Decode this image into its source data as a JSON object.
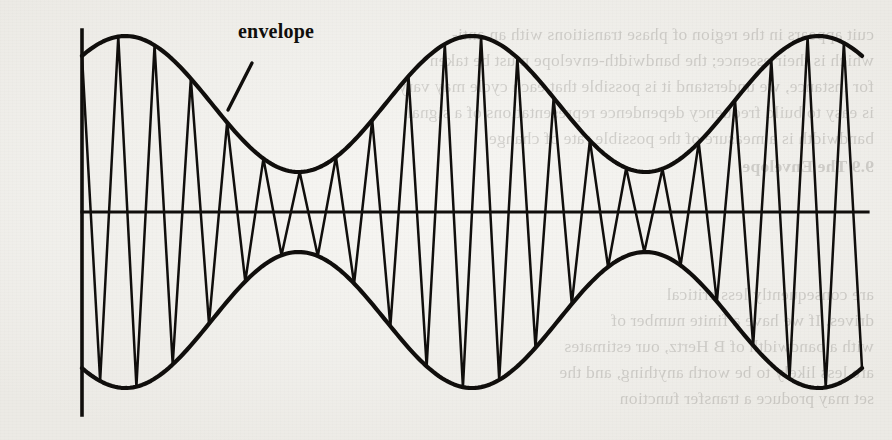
{
  "figure": {
    "caption_labels": {
      "envelope": "envelope",
      "y_axis": "ampl",
      "x_axis": "time"
    },
    "ink_color": "#100e0c",
    "paper_color": "#f2f1ee"
  },
  "chart_data": {
    "type": "line",
    "title": "",
    "subtitle": "",
    "xlabel": "time",
    "ylabel": "ampl",
    "grid": false,
    "legend_position": "none",
    "annotations": [
      {
        "text": "envelope",
        "target": "upper envelope curve",
        "leader_line": {
          "x1": 252,
          "y1": 63,
          "x2": 228,
          "y2": 110
        }
      }
    ],
    "axes": {
      "x_axis_y": 212,
      "y_axis_x": 82,
      "x_axis_from": 82,
      "x_axis_to": 868,
      "y_axis_from": 30,
      "y_axis_to": 415,
      "ticks": [],
      "tick_labels": [],
      "xlim": [
        0,
        1
      ],
      "ylim": [
        -1,
        1
      ]
    },
    "series": [
      {
        "name": "carrier",
        "type": "line",
        "peaks": 22,
        "waveform": "triangular",
        "description": "carrier oscillation filling the envelope"
      },
      {
        "name": "upper envelope",
        "type": "line",
        "waveform": "sinusoidal",
        "cycles": 2.25,
        "description": "upper bound of the modulated amplitude"
      },
      {
        "name": "lower envelope",
        "type": "line",
        "waveform": "sinusoidal",
        "cycles": 2.25,
        "description": "lower bound, mirror image of the upper envelope"
      }
    ],
    "envelope_model": {
      "carrier_count": 22,
      "carrier_start_x": 82,
      "carrier_end_x": 862,
      "modulation_cycles": 2.25,
      "modulation_phase_deg": 45,
      "amplitude_max": 176,
      "amplitude_min": 40,
      "baseline_y": 212
    },
    "x": [
      0.0,
      0.05,
      0.1,
      0.15,
      0.2,
      0.25,
      0.3,
      0.35,
      0.4,
      0.45,
      0.5,
      0.55,
      0.6,
      0.65,
      0.7,
      0.75,
      0.8,
      0.85,
      0.9,
      0.95,
      1.0
    ],
    "envelope_upper": [
      0.63,
      0.86,
      0.99,
      0.97,
      0.8,
      0.55,
      0.31,
      0.17,
      0.19,
      0.36,
      0.61,
      0.85,
      0.99,
      0.96,
      0.78,
      0.52,
      0.29,
      0.17,
      0.21,
      0.4,
      0.65
    ],
    "envelope_lower": [
      -0.63,
      -0.86,
      -0.99,
      -0.97,
      -0.8,
      -0.55,
      -0.31,
      -0.17,
      -0.19,
      -0.36,
      -0.61,
      -0.85,
      -0.99,
      -0.96,
      -0.78,
      -0.52,
      -0.29,
      -0.17,
      -0.21,
      -0.4,
      -0.65
    ]
  },
  "background_bleed": {
    "note": "faint mirror-image show-through from the reverse side of the scanned page",
    "top_lines": [
      "cuit appears in the region of phase transitions with an anti-",
      "which is their essence; the bandwidth-envelope must be taken",
      "for instance, we understand it is possible that each cycle may vary",
      "is easy to build frequency dependence representations of a signal",
      "bandwidth is a measure of the possible rate of change"
    ],
    "top_heading": "9.9  The Envelope",
    "bottom_lines": [
      "are consequently less critical",
      "drives.  If we have a finite number of",
      "with a bandwidth of B Hertz, our estimates",
      "are less likely to be worth anything, and the",
      "set may produce a transfer function"
    ]
  }
}
